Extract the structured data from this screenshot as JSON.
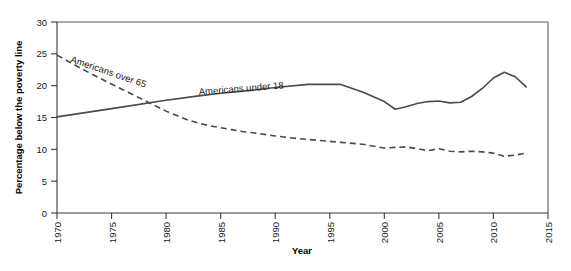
{
  "chart_data": {
    "type": "line",
    "title": "",
    "xlabel": "Year",
    "ylabel": "Percentage below the poverty line",
    "xlim": [
      1970,
      2015
    ],
    "ylim": [
      0,
      30
    ],
    "grid": false,
    "legend_position": "inline-annotation",
    "xticks": [
      "1970",
      "1975",
      "1980",
      "1985",
      "1990",
      "1995",
      "2000",
      "2005",
      "2010",
      "2015"
    ],
    "xtick_values": [
      1970,
      1975,
      1980,
      1985,
      1990,
      1995,
      2000,
      2005,
      2010,
      2015
    ],
    "yticks": [
      "0",
      "5",
      "10",
      "15",
      "20",
      "25",
      "30"
    ],
    "ytick_values": [
      0,
      5,
      10,
      15,
      20,
      25,
      30
    ],
    "series": [
      {
        "name": "Americans over 65",
        "style": "dashed",
        "color": "#4a4a4a",
        "annotation": "Americans over 65",
        "x": [
          1970,
          1972,
          1974,
          1976,
          1978,
          1980,
          1981,
          1982,
          1983,
          1984,
          1985,
          1986,
          1987,
          1988,
          1990,
          1992,
          1994,
          1996,
          1998,
          2000,
          2002,
          2004,
          2005,
          2006,
          2007,
          2008,
          2009,
          2010,
          2011,
          2012,
          2013
        ],
        "values": [
          24.8,
          22.9,
          21.1,
          19.4,
          17.7,
          16.0,
          15.3,
          14.6,
          14.1,
          13.7,
          13.4,
          13.1,
          12.8,
          12.6,
          12.1,
          11.7,
          11.4,
          11.1,
          10.8,
          10.2,
          10.4,
          9.8,
          10.1,
          9.7,
          9.6,
          9.7,
          9.6,
          9.4,
          8.9,
          9.1,
          9.4
        ]
      },
      {
        "name": "Americans under 18",
        "style": "solid",
        "color": "#4a4a4a",
        "annotation": "Americans under 18",
        "x": [
          1970,
          1975,
          1980,
          1983,
          1985,
          1988,
          1990,
          1993,
          1996,
          1998,
          2000,
          2001,
          2002,
          2003,
          2004,
          2005,
          2006,
          2007,
          2008,
          2009,
          2010,
          2011,
          2012,
          2013
        ],
        "values": [
          15.1,
          16.4,
          17.7,
          18.4,
          18.8,
          19.3,
          19.7,
          20.2,
          20.2,
          19.0,
          17.5,
          16.3,
          16.7,
          17.2,
          17.5,
          17.6,
          17.3,
          17.4,
          18.3,
          19.6,
          21.2,
          22.1,
          21.4,
          19.8
        ]
      }
    ]
  },
  "annotations": {
    "over65_label": "Americans over 65",
    "under18_label": "Americans under 18"
  },
  "axes": {
    "x_title": "Year",
    "y_title": "Percentage below the poverty line"
  }
}
